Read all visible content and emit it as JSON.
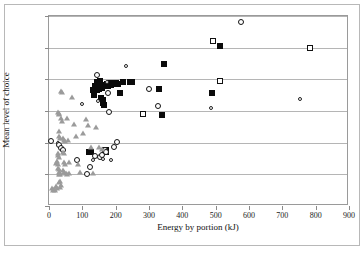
{
  "chart_data": {
    "type": "scatter",
    "title": "",
    "xlabel": "Energy by portion (kJ)",
    "ylabel": "Mean level of choice",
    "xlim": [
      0,
      900
    ],
    "ylim": [
      0.0,
      0.3
    ],
    "xticks": [
      "0",
      "100",
      "200",
      "300",
      "400",
      "500",
      "600",
      "700",
      "800",
      "900"
    ],
    "xtick_values": [
      0,
      100,
      200,
      300,
      400,
      500,
      600,
      700,
      800,
      900
    ],
    "yticks": [
      "0.00",
      "0.05",
      "0.10",
      "0.15",
      "0.20",
      "0.25",
      "0.30"
    ],
    "ytick_values": [
      0.0,
      0.05,
      0.1,
      0.15,
      0.2,
      0.25,
      0.3
    ],
    "grid": "horizontal",
    "legend": "none",
    "series": [
      {
        "name": "filled-square",
        "marker": "filled-square",
        "color": "#0b0b0b",
        "points": [
          [
            120,
            0.086
          ],
          [
            127,
            0.086
          ],
          [
            132,
            0.183
          ],
          [
            134,
            0.176
          ],
          [
            138,
            0.19
          ],
          [
            140,
            0.186
          ],
          [
            143,
            0.183
          ],
          [
            145,
            0.196
          ],
          [
            147,
            0.19
          ],
          [
            150,
            0.184
          ],
          [
            152,
            0.198
          ],
          [
            155,
            0.17
          ],
          [
            157,
            0.191
          ],
          [
            159,
            0.186
          ],
          [
            161,
            0.163
          ],
          [
            163,
            0.167
          ],
          [
            166,
            0.16
          ],
          [
            168,
            0.088
          ],
          [
            170,
            0.086
          ],
          [
            172,
            0.089
          ],
          [
            175,
            0.193
          ],
          [
            178,
            0.19
          ],
          [
            182,
            0.194
          ],
          [
            186,
            0.191
          ],
          [
            190,
            0.195
          ],
          [
            196,
            0.192
          ],
          [
            200,
            0.194
          ],
          [
            206,
            0.193
          ],
          [
            214,
            0.178
          ],
          [
            222,
            0.196
          ],
          [
            244,
            0.196
          ],
          [
            249,
            0.196
          ],
          [
            330,
            0.185
          ],
          [
            338,
            0.143
          ],
          [
            346,
            0.224
          ],
          [
            488,
            0.178
          ],
          [
            514,
            0.252
          ]
        ]
      },
      {
        "name": "open-circle",
        "marker": "open-circle",
        "color": "#111111",
        "points": [
          [
            6,
            0.102
          ],
          [
            28,
            0.099
          ],
          [
            31,
            0.096
          ],
          [
            36,
            0.092
          ],
          [
            38,
            0.088
          ],
          [
            41,
            0.089
          ],
          [
            84,
            0.072
          ],
          [
            99,
            0.161
          ],
          [
            113,
            0.05
          ],
          [
            124,
            0.062
          ],
          [
            131,
            0.072
          ],
          [
            137,
            0.079
          ],
          [
            144,
            0.207
          ],
          [
            148,
            0.166
          ],
          [
            152,
            0.078
          ],
          [
            158,
            0.08
          ],
          [
            163,
            0.075
          ],
          [
            168,
            0.088
          ],
          [
            170,
            0.086
          ],
          [
            174,
            0.196
          ],
          [
            177,
            0.178
          ],
          [
            180,
            0.148
          ],
          [
            186,
            0.073
          ],
          [
            196,
            0.093
          ],
          [
            204,
            0.101
          ],
          [
            231,
            0.221
          ],
          [
            301,
            0.185
          ],
          [
            327,
            0.158
          ],
          [
            487,
            0.155
          ],
          [
            512,
            0.197
          ],
          [
            575,
            0.291
          ],
          [
            753,
            0.169
          ]
        ]
      },
      {
        "name": "open-square",
        "marker": "open-square",
        "color": "#111111",
        "points": [
          [
            283,
            0.146
          ],
          [
            493,
            0.261
          ],
          [
            514,
            0.197
          ],
          [
            783,
            0.249
          ]
        ]
      },
      {
        "name": "gray-triangle",
        "marker": "triangle",
        "color": "#9b9b9b",
        "points": [
          [
            10,
            0.028
          ],
          [
            13,
            0.026
          ],
          [
            16,
            0.027
          ],
          [
            19,
            0.025
          ],
          [
            21,
            0.031
          ],
          [
            24,
            0.028
          ],
          [
            22,
            0.068
          ],
          [
            25,
            0.071
          ],
          [
            27,
            0.066
          ],
          [
            28,
            0.148
          ],
          [
            30,
            0.147
          ],
          [
            31,
            0.146
          ],
          [
            29,
            0.119
          ],
          [
            31,
            0.11
          ],
          [
            33,
            0.107
          ],
          [
            26,
            0.084
          ],
          [
            28,
            0.081
          ],
          [
            30,
            0.078
          ],
          [
            27,
            0.06
          ],
          [
            29,
            0.058
          ],
          [
            31,
            0.054
          ],
          [
            30,
            0.051
          ],
          [
            32,
            0.05
          ],
          [
            33,
            0.052
          ],
          [
            34,
            0.04
          ],
          [
            31,
            0.038
          ],
          [
            35,
            0.033
          ],
          [
            33,
            0.03
          ],
          [
            36,
            0.181
          ],
          [
            39,
            0.18
          ],
          [
            37,
            0.139
          ],
          [
            40,
            0.134
          ],
          [
            43,
            0.108
          ],
          [
            45,
            0.104
          ],
          [
            47,
            0.102
          ],
          [
            41,
            0.086
          ],
          [
            44,
            0.083
          ],
          [
            46,
            0.069
          ],
          [
            48,
            0.066
          ],
          [
            43,
            0.057
          ],
          [
            45,
            0.053
          ],
          [
            50,
            0.052
          ],
          [
            53,
            0.051
          ],
          [
            55,
            0.139
          ],
          [
            57,
            0.104
          ],
          [
            59,
            0.069
          ],
          [
            61,
            0.052
          ],
          [
            70,
            0.172
          ],
          [
            74,
            0.129
          ],
          [
            82,
            0.11
          ],
          [
            86,
            0.066
          ],
          [
            94,
            0.053
          ],
          [
            103,
            0.116
          ],
          [
            110,
            0.137
          ],
          [
            118,
            0.128
          ],
          [
            127,
            0.093
          ],
          [
            133,
            0.052
          ],
          [
            141,
            0.125
          ],
          [
            150,
            0.093
          ],
          [
            158,
            0.09
          ]
        ]
      }
    ]
  }
}
